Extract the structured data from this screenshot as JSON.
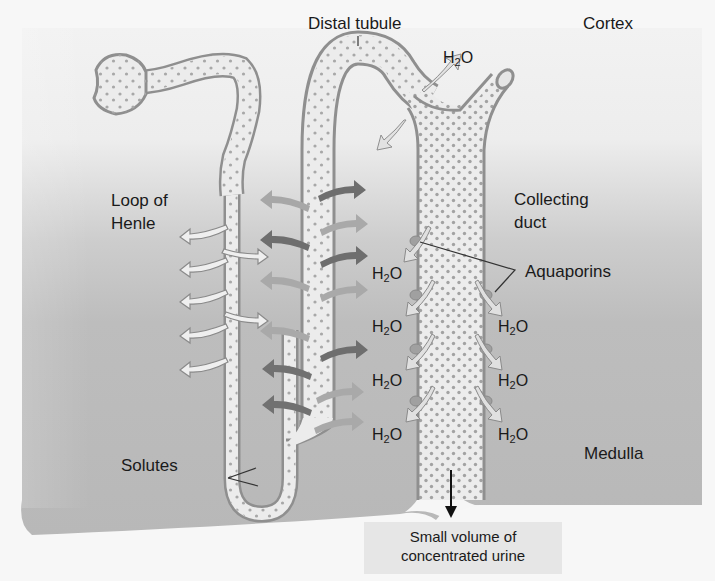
{
  "figure": {
    "partial_caption_top": "",
    "regions": {
      "cortex": "Cortex",
      "medulla": "Medulla"
    },
    "labels": {
      "distal_tubule": "Distal tubule",
      "loop_of_henle_line1": "Loop of",
      "loop_of_henle_line2": "Henle",
      "collecting_duct_line1": "Collecting",
      "collecting_duct_line2": "duct",
      "aquaporins": "Aquaporins",
      "solutes": "Solutes",
      "urine_line1": "Small volume of",
      "urine_line2": "concentrated urine"
    },
    "water": {
      "symbol": "H",
      "subscript": "2",
      "suffix": "O",
      "positions": [
        {
          "id": "top",
          "x": 443,
          "y": 48
        },
        {
          "id": "left-1",
          "x": 372,
          "y": 264
        },
        {
          "id": "left-2",
          "x": 372,
          "y": 317
        },
        {
          "id": "left-3",
          "x": 372,
          "y": 371
        },
        {
          "id": "left-4",
          "x": 372,
          "y": 425
        },
        {
          "id": "right-2",
          "x": 498,
          "y": 317
        },
        {
          "id": "right-3",
          "x": 498,
          "y": 371
        },
        {
          "id": "right-4",
          "x": 498,
          "y": 425
        }
      ]
    },
    "colors": {
      "tubule_wall": "#8f8f8f",
      "tubule_fill": "#eaeaea",
      "solute_dot": "#a5a5a5",
      "medulla_gray": "#b9b9b9",
      "cortex_light": "#f0f0f0",
      "arrow_dark": "#6f6f6f",
      "arrow_mid": "#9a9a9a",
      "arrow_light": "#ececec",
      "aquaporin": "#a0a0a0"
    }
  }
}
